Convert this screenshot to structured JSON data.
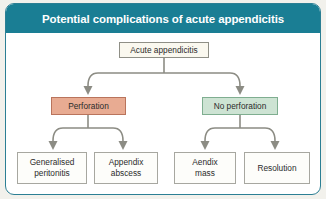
{
  "figure": {
    "title": "Potential complications of acute appendicitis",
    "colors": {
      "header_teal": "#1a7e94",
      "frame_teal": "#2c7f94",
      "perforation_fill": "#e8ab92",
      "no_perforation_fill": "#cde3d3",
      "box_fill": "#fbfaf5",
      "connector_gray": "#8c8c84",
      "outer_background": "#f2f1ec"
    }
  },
  "diagram": {
    "type": "flowchart",
    "root": {
      "label": "Acute appendicitis"
    },
    "branches": [
      {
        "label": "Perforation",
        "children": [
          {
            "line1": "Generalised",
            "line2": "peritonitis"
          },
          {
            "line1": "Appendix",
            "line2": "abscess"
          }
        ]
      },
      {
        "label": "No perforation",
        "children": [
          {
            "line1": "Aendix",
            "line2": "mass"
          },
          {
            "line1": "Resolution",
            "line2": ""
          }
        ]
      }
    ]
  }
}
